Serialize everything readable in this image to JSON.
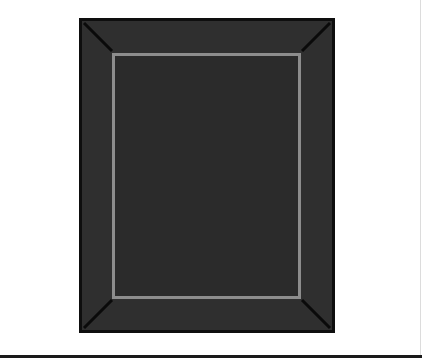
{
  "image": {
    "subject": "dark rectangular rug with light grey inner border",
    "colors": {
      "background": "#ffffff",
      "rug_field": "#2f2f2f",
      "rug_outline": "#0e0e0e",
      "inner_border": "#8d8d8d",
      "corner_lines": "#0a0a0a",
      "bottom_bar": "#1a1a1a"
    }
  }
}
